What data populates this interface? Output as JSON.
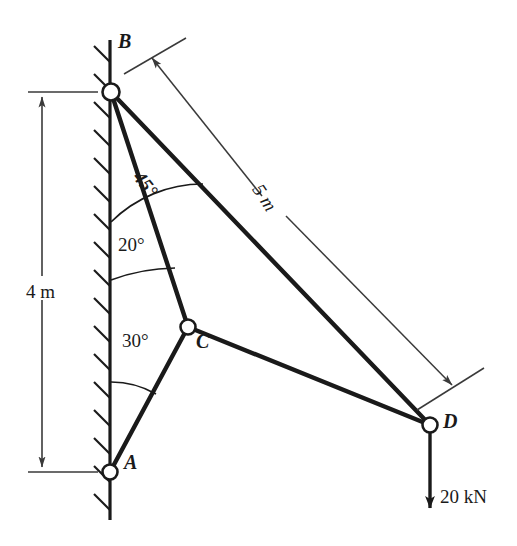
{
  "figure": {
    "background_color": "#ffffff",
    "line_color": "#1a1a1a",
    "joint_fill_color": "#ffffff"
  },
  "joints": [
    {
      "id": "A",
      "label": "A",
      "x": 110,
      "y": 472,
      "label_x": 124,
      "label_y": 462
    },
    {
      "id": "B",
      "label": "B",
      "x": 111,
      "y": 92,
      "label_x": 120,
      "label_y": 38
    },
    {
      "id": "C",
      "label": "C",
      "x": 188,
      "y": 327,
      "label_x": 196,
      "label_y": 340
    },
    {
      "id": "D",
      "label": "D",
      "x": 430,
      "y": 425,
      "label_x": 443,
      "label_y": 419
    }
  ],
  "members": [
    {
      "from": "A",
      "to": "C"
    },
    {
      "from": "B",
      "to": "C"
    },
    {
      "from": "B",
      "to": "D"
    },
    {
      "from": "C",
      "to": "D"
    }
  ],
  "wall": {
    "x": 110,
    "top_y": 40,
    "bottom_y": 520,
    "hatch_count": 17,
    "hatch_direction": "up-right"
  },
  "angles": [
    {
      "id": "angle-45",
      "value": "45°",
      "at_joint": "B",
      "between": "wall and BD",
      "label_x": 148,
      "label_y": 170
    },
    {
      "id": "angle-20",
      "value": "20°",
      "at_joint": "B",
      "between": "wall and BC",
      "label_x": 120,
      "label_y": 243
    },
    {
      "id": "angle-30",
      "value": "30°",
      "at_joint": "A",
      "between": "wall and AC",
      "label_x": 124,
      "label_y": 338
    }
  ],
  "dimensions": [
    {
      "id": "dim-4m",
      "value": "4 m",
      "orientation": "vertical",
      "label_x": 26,
      "label_y": 292,
      "from_y": 92,
      "to_y": 472,
      "line_x": 42,
      "extension_left": 14,
      "extension_right": 70
    },
    {
      "id": "dim-5m",
      "value": "5 m",
      "orientation": "diagonal",
      "label_x": 268,
      "label_y": 182,
      "spans": "B to D"
    }
  ],
  "load": {
    "id": "load-20kn",
    "value": "20 kN",
    "label_x": 440,
    "label_y": 497,
    "arrow_from": {
      "x": 430,
      "y": 432
    },
    "arrow_to": {
      "x": 430,
      "y": 512
    },
    "direction": "downward"
  }
}
